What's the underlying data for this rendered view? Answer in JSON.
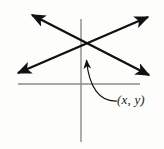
{
  "figure": {
    "name": "two-intersecting-lines-graph",
    "background_color": "#fdfdfc",
    "line_color": "#111111",
    "axis_color": "#8a8a8a",
    "label_color": "#1a1a1a"
  },
  "axes": {
    "x_axis": {
      "name": "x-axis",
      "x1": 18,
      "y1": 84,
      "x2": 140,
      "y2": 84,
      "stroke_width": 1.4
    },
    "y_axis": {
      "name": "y-axis",
      "x1": 81,
      "y1": 19,
      "x2": 81,
      "y2": 142,
      "stroke_width": 1.4
    }
  },
  "lines": [
    {
      "name": "line-rising",
      "description": "double-headed arrow line rising to the right",
      "x1": 16,
      "y1": 74,
      "x2": 150,
      "y2": 15,
      "stroke_width": 2.4,
      "arrow_start": true,
      "arrow_end": true
    },
    {
      "name": "line-falling",
      "description": "double-headed arrow line falling to the right",
      "x1": 30,
      "y1": 13,
      "x2": 151,
      "y2": 77,
      "stroke_width": 2.4,
      "arrow_start": true,
      "arrow_end": true
    }
  ],
  "intersection": {
    "name": "intersection-point",
    "x": 85,
    "y": 43
  },
  "leader": {
    "name": "leader-curve",
    "description": "curved arrow from label up to intersection point",
    "path": "M 116 101 C 101 101, 90 86, 87 62",
    "stroke_width": 1.2,
    "arrow_end": true
  },
  "label": {
    "name": "point-label",
    "text": "(x, y)"
  }
}
